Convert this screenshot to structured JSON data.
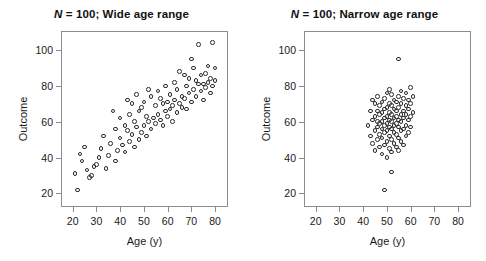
{
  "figure": {
    "width": 486,
    "height": 261,
    "background": "#ffffff",
    "marker_color": "#2b2b2b",
    "axis_color": "#8d8d8d"
  },
  "chart_data": [
    {
      "type": "scatter",
      "panel": "left",
      "title": "N = 100; Wide age range",
      "title_italic_prefix": "N",
      "title_rest": " = 100; Wide age range",
      "xlabel": "Age (y)",
      "ylabel": "Outcome",
      "xticks": [
        20,
        30,
        40,
        50,
        60,
        70,
        80
      ],
      "yticks": [
        20,
        40,
        60,
        80,
        100
      ],
      "xlim": [
        15.5,
        85.0
      ],
      "ylim": [
        13.0,
        110.0
      ],
      "grid": false,
      "legend": null,
      "n": 100,
      "marker": "open-circle",
      "x": [
        21,
        22,
        23,
        24,
        25,
        26,
        27,
        28,
        29,
        30,
        31,
        32,
        33,
        34,
        35,
        36,
        37,
        38,
        38,
        39,
        40,
        40,
        41,
        42,
        42,
        43,
        43,
        44,
        44,
        45,
        45,
        46,
        46,
        47,
        47,
        48,
        48,
        49,
        49,
        50,
        50,
        51,
        51,
        52,
        52,
        53,
        53,
        54,
        55,
        55,
        56,
        56,
        57,
        57,
        58,
        58,
        59,
        59,
        60,
        60,
        61,
        61,
        62,
        62,
        63,
        63,
        64,
        64,
        65,
        65,
        66,
        66,
        67,
        67,
        68,
        68,
        69,
        69,
        70,
        70,
        71,
        71,
        72,
        72,
        73,
        73,
        74,
        74,
        75,
        75,
        76,
        76,
        77,
        77,
        78,
        78,
        79,
        79,
        80,
        80
      ],
      "y": [
        31,
        22,
        42,
        38,
        46,
        33,
        29,
        30,
        35,
        36,
        40,
        45,
        52,
        34,
        41,
        48,
        66,
        38,
        56,
        44,
        51,
        62,
        47,
        43,
        58,
        55,
        72,
        49,
        64,
        53,
        70,
        46,
        60,
        57,
        75,
        50,
        66,
        54,
        68,
        58,
        71,
        52,
        63,
        60,
        78,
        56,
        74,
        62,
        59,
        69,
        64,
        77,
        61,
        73,
        58,
        70,
        66,
        80,
        63,
        71,
        67,
        75,
        60,
        69,
        72,
        82,
        65,
        78,
        70,
        88,
        68,
        74,
        73,
        86,
        67,
        80,
        76,
        84,
        71,
        95,
        78,
        90,
        74,
        83,
        81,
        103,
        77,
        86,
        72,
        81,
        79,
        87,
        82,
        91,
        76,
        84,
        80,
        104,
        83,
        90
      ]
    },
    {
      "type": "scatter",
      "panel": "right",
      "title": "N = 100; Narrow age range",
      "title_italic_prefix": "N",
      "title_rest": " = 100; Narrow age range",
      "xlabel": "Age (y)",
      "ylabel": "Outcome",
      "xticks": [
        20,
        30,
        40,
        50,
        60,
        70,
        80
      ],
      "yticks": [
        20,
        40,
        60,
        80,
        100
      ],
      "xlim": [
        15.5,
        85.0
      ],
      "ylim": [
        13.0,
        110.0
      ],
      "grid": false,
      "legend": null,
      "n": 100,
      "marker": "open-circle",
      "x": [
        42,
        43,
        43,
        44,
        44,
        44,
        45,
        45,
        45,
        45,
        46,
        46,
        46,
        46,
        46,
        47,
        47,
        47,
        47,
        47,
        48,
        48,
        48,
        48,
        48,
        48,
        49,
        49,
        49,
        49,
        49,
        49,
        50,
        50,
        50,
        50,
        50,
        50,
        50,
        51,
        51,
        51,
        51,
        51,
        51,
        51,
        52,
        52,
        52,
        52,
        52,
        52,
        52,
        53,
        53,
        53,
        53,
        53,
        53,
        54,
        54,
        54,
        54,
        54,
        54,
        55,
        55,
        55,
        55,
        55,
        55,
        56,
        56,
        56,
        56,
        56,
        56,
        57,
        57,
        57,
        57,
        57,
        58,
        58,
        58,
        58,
        58,
        59,
        59,
        59,
        59,
        60,
        60,
        60,
        60,
        61,
        61,
        49,
        52,
        55
      ],
      "y": [
        58,
        52,
        66,
        48,
        61,
        72,
        44,
        55,
        63,
        70,
        50,
        57,
        60,
        66,
        74,
        46,
        53,
        59,
        64,
        69,
        42,
        51,
        56,
        60,
        65,
        71,
        47,
        54,
        58,
        62,
        67,
        73,
        40,
        49,
        55,
        59,
        63,
        68,
        76,
        45,
        52,
        57,
        61,
        65,
        70,
        78,
        43,
        50,
        56,
        60,
        64,
        69,
        75,
        48,
        54,
        58,
        62,
        67,
        72,
        46,
        53,
        59,
        63,
        66,
        71,
        44,
        51,
        57,
        61,
        68,
        74,
        49,
        55,
        60,
        64,
        70,
        77,
        47,
        56,
        62,
        66,
        73,
        52,
        58,
        64,
        69,
        76,
        54,
        61,
        67,
        72,
        57,
        63,
        70,
        79,
        65,
        74,
        22,
        32,
        95
      ]
    }
  ]
}
